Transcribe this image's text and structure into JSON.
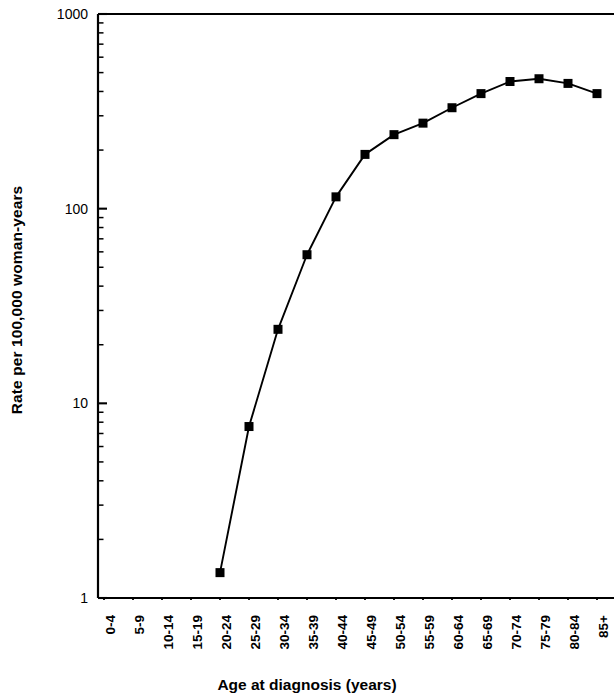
{
  "chart_data": {
    "type": "line",
    "title": "",
    "xlabel": "Age at diagnosis (years)",
    "ylabel": "Rate per 100,000 woman-years",
    "yscale": "log",
    "ylim": [
      1,
      1000
    ],
    "ytick_labels": [
      "1000",
      "100",
      "10",
      "1"
    ],
    "ytick_values": [
      1000,
      100,
      10,
      1
    ],
    "grid": false,
    "legend": null,
    "marker": "filled-square",
    "line_color": "#000000",
    "marker_color": "#000000",
    "categories": [
      "0-4",
      "5-9",
      "10-14",
      "15-19",
      "20-24",
      "25-29",
      "30-34",
      "35-39",
      "40-44",
      "45-49",
      "50-54",
      "55-59",
      "60-64",
      "65-69",
      "70-74",
      "75-79",
      "80-84",
      "85+"
    ],
    "values": [
      null,
      null,
      null,
      null,
      1.35,
      7.6,
      24,
      58,
      115,
      190,
      240,
      275,
      330,
      390,
      450,
      465,
      440,
      390
    ],
    "series": [
      {
        "name": "Rate per 100,000 woman-years",
        "values": [
          null,
          null,
          null,
          null,
          1.35,
          7.6,
          24,
          58,
          115,
          190,
          240,
          275,
          330,
          390,
          450,
          465,
          440,
          390
        ]
      }
    ]
  },
  "axes": {
    "y_title": "Rate per 100,000 woman-years",
    "x_title": "Age at diagnosis (years)"
  }
}
